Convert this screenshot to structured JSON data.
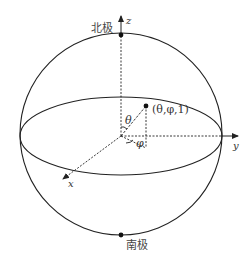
{
  "diagram": {
    "type": "bloch-sphere",
    "labels": {
      "north_pole": "北极",
      "south_pole": "南极",
      "z_axis": "z",
      "y_axis": "y",
      "x_axis": "x",
      "theta": "θ",
      "phi": "φ",
      "point": "(θ,φ,1)"
    },
    "colors": {
      "stroke": "#222222",
      "text": "#333333",
      "background": "#ffffff"
    }
  }
}
